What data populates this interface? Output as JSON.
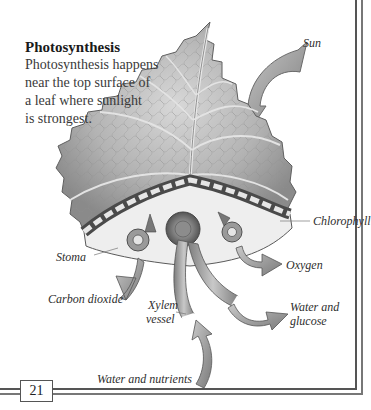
{
  "intro": {
    "heading": "Photosynthesis",
    "body_lines": [
      "Photosynthesis happens",
      "near the top surface of",
      "a leaf where sunlight",
      "is strongest."
    ]
  },
  "labels": {
    "sun": "Sun",
    "chlorophyll": "Chlorophyll",
    "stoma": "Stoma",
    "oxygen": "Oxygen",
    "carbon_dioxide": "Carbon dioxide",
    "xylem_line1": "Xylem",
    "xylem_line2": "vessel",
    "water_glucose_line1": "Water and",
    "water_glucose_line2": "glucose",
    "water_nutrients": "Water and nutrients"
  },
  "page": {
    "number": "21"
  },
  "colors": {
    "frame": "#555555",
    "text": "#2b2b2b",
    "illustration_gray": "#9a9a9a"
  }
}
